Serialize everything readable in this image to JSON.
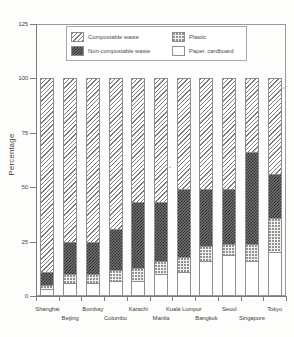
{
  "chart_data": {
    "type": "bar",
    "subtype": "stacked-bar-100",
    "title": "",
    "xlabel": "",
    "ylabel": "Percentage",
    "ylim": [
      0,
      125
    ],
    "yticks": [
      0,
      25,
      50,
      75,
      100,
      125
    ],
    "grid": false,
    "legend_position": "top-center-inside",
    "categories": [
      "Shanghai",
      "Beijing",
      "Bombay",
      "Colombo",
      "Karachi",
      "Manila",
      "Kuala Lumpur",
      "Bangkok",
      "Seoul",
      "Singapore",
      "Tokyo"
    ],
    "series": [
      {
        "name": "Paper, cardboard",
        "pattern": "blank",
        "values": [
          3,
          6,
          6,
          7,
          7,
          10,
          11,
          16,
          19,
          16,
          20
        ]
      },
      {
        "name": "Plastic",
        "pattern": "dotted",
        "values": [
          2,
          4,
          4,
          5,
          6,
          6,
          7,
          7,
          5,
          8,
          16
        ]
      },
      {
        "name": "Non-compostable waste",
        "pattern": "checkerboard",
        "values": [
          6,
          15,
          15,
          19,
          30,
          27,
          31,
          26,
          25,
          42,
          20
        ]
      },
      {
        "name": "Compostable waste",
        "pattern": "diagonal",
        "values": [
          89,
          75,
          75,
          69,
          57,
          57,
          51,
          51,
          51,
          34,
          44
        ]
      }
    ]
  },
  "legend": {
    "items": [
      {
        "label": "Compostable waste",
        "pattern": "diagonal"
      },
      {
        "label": "Plastic",
        "pattern": "dotted"
      },
      {
        "label": "Non-compostable waste",
        "pattern": "checkerboard"
      },
      {
        "label": "Paper, cardboard",
        "pattern": "blank"
      }
    ]
  },
  "axis": {
    "y_title": "Percentage",
    "y_tick_labels": [
      "0",
      "25",
      "50",
      "75",
      "100",
      "125"
    ]
  }
}
